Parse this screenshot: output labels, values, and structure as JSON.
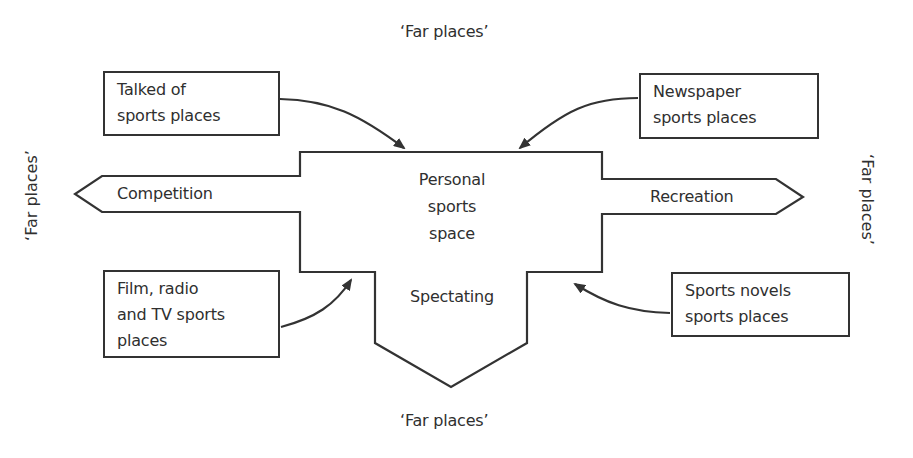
{
  "diagram": {
    "center": {
      "label_lines": [
        "Personal",
        "sports",
        "space"
      ],
      "spectating": "Spectating"
    },
    "arms": {
      "left": "Competition",
      "right": "Recreation"
    },
    "far_places": {
      "top": "‘Far places’",
      "bottom": "‘Far places’",
      "left": "‘Far places’",
      "right": "‘Far places’"
    },
    "boxes": {
      "top_left": "Talked of\nsports places",
      "top_right": "Newspaper\nsports places",
      "bottom_left": "Film, radio\nand TV sports\nplaces",
      "bottom_right": "Sports novels\nsports places"
    },
    "colors": {
      "line": "#333333",
      "text": "#2f2f2f",
      "background": "#ffffff"
    }
  }
}
